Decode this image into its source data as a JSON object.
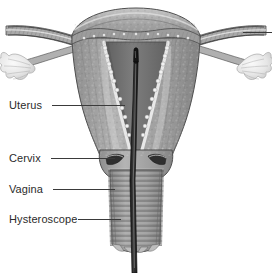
{
  "figure": {
    "type": "anatomical-illustration",
    "width": 272,
    "height": 273,
    "background_color": "#ffffff",
    "style": "grayscale medical line-and-tone drawing"
  },
  "palette": {
    "background": "#ffffff",
    "text": "#2b2b2b",
    "leader_line": "#3a3a3a",
    "myometrium_light": "#b9b9b9",
    "myometrium_mid": "#9a9a9a",
    "myometrium_dark": "#7c7c7c",
    "cavity_dark": "#6f6f6f",
    "endometrium_light": "#e2e2e2",
    "fimbriae_light": "#ededed",
    "instrument_dark": "#1e1e1e",
    "outline": "#4a4a4a"
  },
  "labels": [
    {
      "id": "uterus",
      "text": "Uterus",
      "x": 9,
      "y": 100,
      "leader_x": 52,
      "leader_y": 105,
      "leader_w": 73
    },
    {
      "id": "cervix",
      "text": "Cervix",
      "x": 9,
      "y": 153,
      "leader_x": 51,
      "leader_y": 158,
      "leader_w": 64
    },
    {
      "id": "vagina",
      "text": "Vagina",
      "x": 9,
      "y": 184,
      "leader_x": 53,
      "leader_y": 189,
      "leader_w": 62
    },
    {
      "id": "hysteroscope",
      "text": "Hysteroscope",
      "x": 9,
      "y": 214,
      "leader_x": 78,
      "leader_y": 219,
      "leader_w": 43
    }
  ],
  "unlabeled_leaders": [
    {
      "id": "fallopian-tube-leader",
      "x": 243,
      "y": 32,
      "w": 29
    }
  ],
  "structures": [
    {
      "id": "uterine-fundus",
      "name": "Uterine fundus"
    },
    {
      "id": "myometrium",
      "name": "Myometrium (uterine wall)"
    },
    {
      "id": "endometrium",
      "name": "Endometrial lining"
    },
    {
      "id": "uterine-cavity",
      "name": "Uterine cavity"
    },
    {
      "id": "fallopian-tube-left",
      "name": "Left fallopian tube"
    },
    {
      "id": "fallopian-tube-right",
      "name": "Right fallopian tube"
    },
    {
      "id": "fimbriae-left",
      "name": "Left fimbriae / ovary"
    },
    {
      "id": "fimbriae-right",
      "name": "Right fimbriae / ovary"
    },
    {
      "id": "cervix-body",
      "name": "Cervix"
    },
    {
      "id": "cervical-os",
      "name": "Cervical os"
    },
    {
      "id": "vaginal-canal",
      "name": "Vaginal canal with rugae"
    },
    {
      "id": "hysteroscope-shaft",
      "name": "Hysteroscope shaft"
    },
    {
      "id": "hysteroscope-tip",
      "name": "Hysteroscope tip"
    }
  ]
}
